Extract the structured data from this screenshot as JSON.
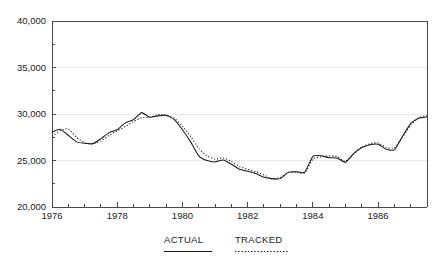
{
  "chart_data": {
    "type": "line",
    "title": "",
    "subtitle": "",
    "xlabel": "",
    "ylabel": "",
    "xlim": [
      1976.0,
      1987.5
    ],
    "ylim": [
      20000,
      40000
    ],
    "grid": true,
    "legend_position": "below-axis",
    "y_ticks": [
      20000,
      25000,
      30000,
      35000,
      40000
    ],
    "y_tick_labels": [
      "20,000",
      "25,000",
      "30,000",
      "35,000",
      "40,000"
    ],
    "x_ticks": [
      1976,
      1978,
      1980,
      1982,
      1984,
      1986
    ],
    "x_tick_labels": [
      "1976",
      "1978",
      "1980",
      "1982",
      "1984",
      "1986"
    ],
    "x_minor_tick_step": 0.5,
    "x": [
      1976.0,
      1976.25,
      1976.5,
      1976.75,
      1977.0,
      1977.25,
      1977.5,
      1977.75,
      1978.0,
      1978.25,
      1978.5,
      1978.75,
      1979.0,
      1979.25,
      1979.5,
      1979.75,
      1980.0,
      1980.25,
      1980.5,
      1980.75,
      1981.0,
      1981.25,
      1981.5,
      1981.75,
      1982.0,
      1982.25,
      1982.5,
      1982.75,
      1983.0,
      1983.25,
      1983.5,
      1983.75,
      1984.0,
      1984.25,
      1984.5,
      1984.75,
      1985.0,
      1985.25,
      1985.5,
      1985.75,
      1986.0,
      1986.25,
      1986.5,
      1986.75,
      1987.0,
      1987.25,
      1987.5
    ],
    "series": [
      {
        "name": "ACTUAL",
        "style": "solid",
        "color": "#1a1a1a",
        "values": [
          28050,
          28350,
          27700,
          27000,
          26850,
          26800,
          27350,
          28000,
          28300,
          29050,
          29400,
          30150,
          29650,
          29800,
          29850,
          29400,
          28300,
          27000,
          25500,
          25000,
          24850,
          25050,
          24600,
          24050,
          23850,
          23600,
          23200,
          23050,
          23050,
          23750,
          23800,
          23750,
          25450,
          25500,
          25300,
          25250,
          24800,
          25750,
          26400,
          26700,
          26750,
          26200,
          26150,
          27600,
          29000,
          29550,
          29700
        ]
      },
      {
        "name": "TRACKED",
        "style": "dotted",
        "color": "#1a1a1a",
        "values": [
          27600,
          28200,
          28400,
          27500,
          26900,
          26800,
          27100,
          27700,
          28200,
          28650,
          29200,
          29600,
          29650,
          29950,
          29900,
          29550,
          28700,
          27600,
          26300,
          25500,
          25150,
          25300,
          24900,
          24350,
          24050,
          23800,
          23450,
          23000,
          23200,
          23700,
          23750,
          23650,
          25150,
          25400,
          25500,
          25400,
          24900,
          25700,
          26450,
          26800,
          26900,
          26400,
          26350,
          27500,
          28800,
          29600,
          29850
        ]
      }
    ]
  },
  "legend": {
    "items": [
      {
        "label": "ACTUAL",
        "style": "solid"
      },
      {
        "label": "TRACKED",
        "style": "dotted"
      }
    ]
  },
  "colors": {
    "line": "#1a1a1a",
    "axis": "#4a4a4a",
    "grid": "#e9e9e9",
    "background": "#ffffff"
  }
}
